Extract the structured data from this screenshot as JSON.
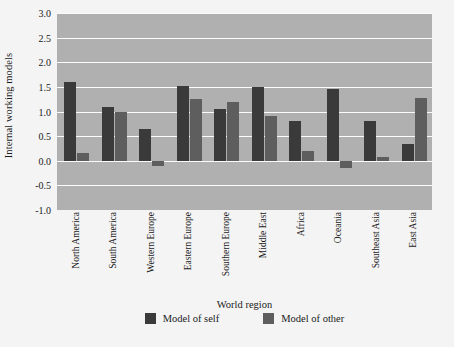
{
  "chart_data": {
    "type": "bar",
    "title": "",
    "xlabel": "World region",
    "ylabel": "Internal working models",
    "ylim": [
      -1.0,
      3.0
    ],
    "ytick_labels": [
      "3.0",
      "2.5",
      "2.0",
      "1.5",
      "1.0",
      "0.5",
      "0.0",
      "-0.5",
      "-1.0"
    ],
    "ytick_values": [
      3.0,
      2.5,
      2.0,
      1.5,
      1.0,
      0.5,
      0.0,
      -0.5,
      -1.0
    ],
    "grid": true,
    "legend_position": "bottom",
    "categories": [
      "North America",
      "South America",
      "Western Europe",
      "Eastern Europe",
      "Southern Europe",
      "Middle East",
      "Africa",
      "Oceania",
      "Southeast Asia",
      "East Asia"
    ],
    "series": [
      {
        "name": "Model of self",
        "color": "#3a3a3a",
        "values": [
          1.6,
          1.1,
          0.65,
          1.52,
          1.05,
          1.5,
          0.8,
          1.45,
          0.8,
          0.35
        ]
      },
      {
        "name": "Model of other",
        "color": "#5e5e5e",
        "values": [
          0.15,
          1.0,
          -0.1,
          1.25,
          1.2,
          0.9,
          0.2,
          -0.15,
          0.07,
          1.28
        ]
      }
    ]
  },
  "colors": {
    "plot_background": "#b0b0b0",
    "page_background": "#f4f4f4",
    "gridline": "#fbfbfb",
    "series_self": "#3a3a3a",
    "series_other": "#5e5e5e"
  }
}
